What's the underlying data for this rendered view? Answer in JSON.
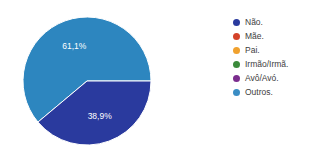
{
  "chart_data": {
    "type": "pie",
    "title": "",
    "labels": [
      "Não.",
      "Outros."
    ],
    "values": [
      38.9,
      61.1
    ],
    "value_labels": [
      "38,9%",
      "61,1%"
    ],
    "colors": [
      "#2a3a9e",
      "#2d86bf"
    ],
    "legend_position": "right",
    "grid": false,
    "start_angle_deg": 0,
    "direction": "clockwise",
    "slices": [
      {
        "name": "Não.",
        "value": 38.9,
        "label": "38,9%",
        "color": "#2a3a9e"
      },
      {
        "name": "Outros.",
        "value": 61.1,
        "label": "61,1%",
        "color": "#2d86bf"
      }
    ]
  },
  "legend": {
    "items": [
      {
        "label": "Não.",
        "color": "#2a3a9e"
      },
      {
        "label": "Mãe.",
        "color": "#d4432a"
      },
      {
        "label": "Pai.",
        "color": "#f0a12e"
      },
      {
        "label": "Irmão/Irmã.",
        "color": "#3b8b3b"
      },
      {
        "label": "Avô/Avó.",
        "color": "#7b2d8e"
      },
      {
        "label": "Outros.",
        "color": "#3a8dc4"
      }
    ]
  },
  "pie_labels": {
    "light_slice": "61,1%",
    "dark_slice": "38,9%"
  }
}
